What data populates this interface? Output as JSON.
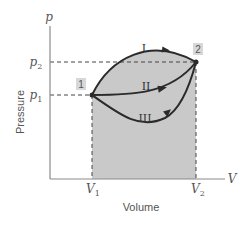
{
  "diagram": {
    "axes": {
      "y_symbol": "p",
      "x_symbol": "V",
      "y_label": "Pressure",
      "x_label": "Volume",
      "y_ticks": [
        {
          "main": "p",
          "sub": "2"
        },
        {
          "main": "p",
          "sub": "1"
        }
      ],
      "x_ticks": [
        {
          "main": "V",
          "sub": "1"
        },
        {
          "main": "V",
          "sub": "2"
        }
      ]
    },
    "states": [
      {
        "label": "1"
      },
      {
        "label": "2"
      }
    ],
    "paths": [
      {
        "label": "I"
      },
      {
        "label": "II"
      },
      {
        "label": "III"
      }
    ],
    "colors": {
      "shade": "#c8c8c8",
      "curve": "#2a2a2a",
      "axis": "#8a8a8a",
      "badge": "#d8d8d8"
    }
  }
}
